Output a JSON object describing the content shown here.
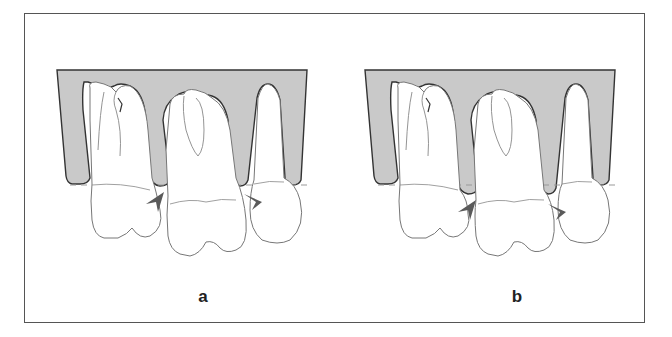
{
  "figure": {
    "panels": [
      {
        "id": "a",
        "label": "a",
        "arrowheads": "crown-level, pointing at interproximal contacts below bone crest"
      },
      {
        "id": "b",
        "label": "b",
        "arrowheads": "lower, pointing at contacts further below the dashed line"
      }
    ],
    "elements": {
      "bone": "gray alveolar bone block",
      "teeth": [
        "premolar (two-rooted)",
        "molar",
        "canine / premolar (single root)"
      ],
      "reference_line": "dashed horizontal line at alveolar crest",
      "arrows": "dark gray arrowheads"
    },
    "colors": {
      "bone_fill": "#c9c9c9",
      "outline": "#444444",
      "tooth_line": "#888888",
      "arrow": "#5a5a5a",
      "frame": "#555555",
      "dashed_line": "#999999"
    }
  }
}
